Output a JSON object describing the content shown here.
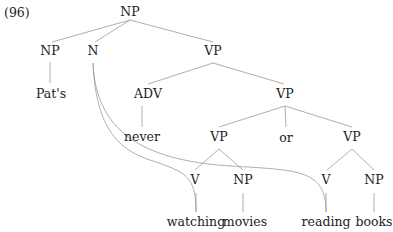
{
  "example_number": "(96)",
  "tree": {
    "root": "NP",
    "nodes": {
      "np_root": "NP",
      "np_poss": "NP",
      "n": "N",
      "vp1": "VP",
      "pats": "Pat's",
      "adv": "ADV",
      "vp2": "VP",
      "never": "never",
      "vp3": "VP",
      "or": "or",
      "vp4": "VP",
      "v1": "V",
      "np1": "NP",
      "v2": "V",
      "np2": "NP",
      "watching": "watching",
      "movies": "movies",
      "reading": "reading",
      "books": "books"
    },
    "edges": [
      [
        "NP",
        "NP"
      ],
      [
        "NP",
        "N"
      ],
      [
        "NP",
        "VP"
      ],
      [
        "NP",
        "Pat's"
      ],
      [
        "VP",
        "ADV"
      ],
      [
        "VP",
        "VP"
      ],
      [
        "ADV",
        "never"
      ],
      [
        "VP",
        "VP"
      ],
      [
        "VP",
        "or"
      ],
      [
        "VP",
        "VP"
      ],
      [
        "VP",
        "V"
      ],
      [
        "VP",
        "NP"
      ],
      [
        "VP",
        "V"
      ],
      [
        "VP",
        "NP"
      ],
      [
        "V",
        "watching"
      ],
      [
        "NP",
        "movies"
      ],
      [
        "V",
        "reading"
      ],
      [
        "NP",
        "books"
      ]
    ],
    "curved_links": [
      [
        "N",
        "watching"
      ],
      [
        "N",
        "reading"
      ]
    ]
  },
  "colors": {
    "line": "#9a9a9a",
    "text": "#222222"
  }
}
